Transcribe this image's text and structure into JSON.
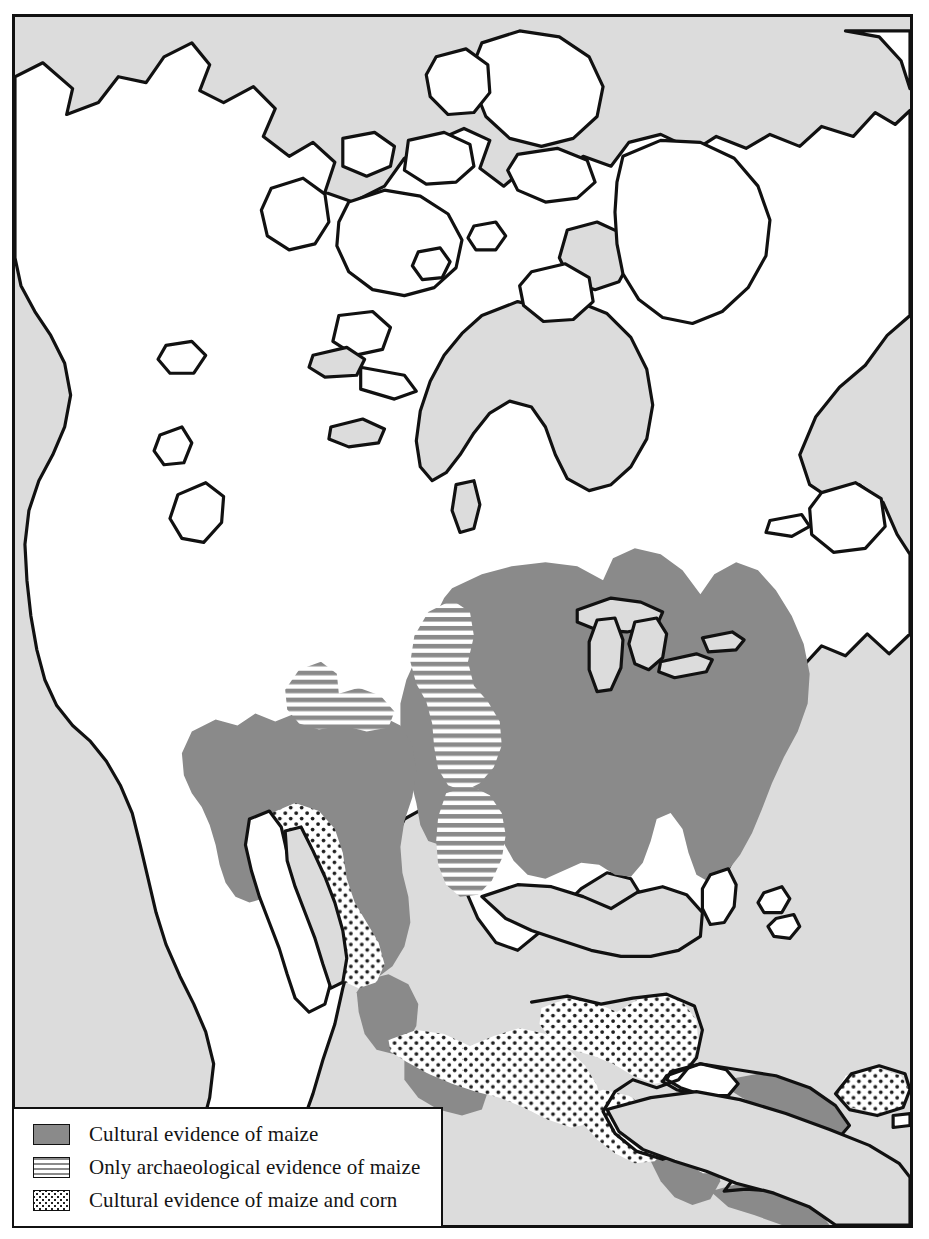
{
  "map": {
    "title": "Distribution of maize evidence in North America",
    "region": "North America, Mesoamerica and the Caribbean",
    "colors": {
      "ocean": "#dcdcdc",
      "land_unshaded": "#ffffff",
      "cultural_maize": "#8a8a8a",
      "archaeological_stripe": "#8a8a8a",
      "stipple_dot": "#222222",
      "coastline": "#111111",
      "frame": "#111111",
      "legend_background": "#ffffff"
    },
    "areas": {
      "cultural_evidence_of_maize": [
        "Eastern United States",
        "Midwest",
        "Southeast",
        "Southwest United States",
        "Southern Ontario",
        "Pacific Northwest interior",
        "Western Mexico",
        "Central Cuba",
        "Nicaragua",
        "Panama",
        "Northwestern Colombia"
      ],
      "only_archaeological_evidence_of_maize": [
        "Great Basin",
        "Northern Plains",
        "Central Plains",
        "Texas interior"
      ],
      "cultural_evidence_of_maize_and_corn": [
        "Northwest Mexico",
        "Sonora",
        "Sinaloa",
        "Central Mexico",
        "Southern Mexico",
        "Yucatan Peninsula",
        "Guatemala",
        "Honduras",
        "Costa Rica",
        "Hispaniola"
      ],
      "unshaded": [
        "Alaska",
        "Northern Canada",
        "Canadian Arctic Archipelago",
        "Greenland coast",
        "Baja California",
        "Northern Mexico desert",
        "Southern Florida",
        "Jamaica",
        "Western Cuba",
        "Bahamas"
      ]
    }
  },
  "legend": {
    "items": [
      {
        "pattern": "solid-gray-swatch",
        "label": "Cultural evidence of maize"
      },
      {
        "pattern": "horizontal-stripe-swatch",
        "label": "Only archaeological evidence of maize"
      },
      {
        "pattern": "stipple-dot-swatch",
        "label": "Cultural evidence of maize and corn"
      }
    ]
  }
}
